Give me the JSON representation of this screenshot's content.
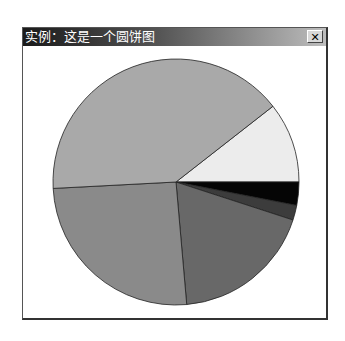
{
  "window": {
    "title": "实例：这是一个圆饼图",
    "close_label": "✕"
  },
  "chart_data": {
    "type": "pie",
    "title": "实例：这是一个圆饼图",
    "start_angle_deg": -38,
    "slices": [
      {
        "label": "slice-1",
        "degrees": 38,
        "color": "#ececec"
      },
      {
        "label": "slice-2",
        "degrees": 11,
        "color": "#050505"
      },
      {
        "label": "slice-3",
        "degrees": 7,
        "color": "#3c3c3c"
      },
      {
        "label": "slice-4",
        "degrees": 67,
        "color": "#686868"
      },
      {
        "label": "slice-5",
        "degrees": 92,
        "color": "#8a8a8a"
      },
      {
        "label": "slice-6",
        "degrees": 145,
        "color": "#a9a9a9"
      }
    ],
    "legend": "none",
    "grid": false
  }
}
